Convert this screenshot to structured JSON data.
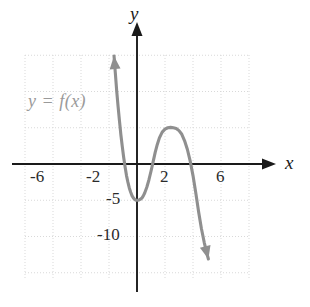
{
  "figure": {
    "background_color": "#ffffff",
    "curve_color": "#8f8f8f",
    "axis_color": "#1a1a1a",
    "grid_color": "#d9d9d9",
    "label_color": "#3a3a3a",
    "function_label_color": "#9a9a9a"
  },
  "labels": {
    "x_axis": "x",
    "y_axis": "y",
    "function": "y = f(x)"
  },
  "chart_data": {
    "type": "line",
    "title": "",
    "xlabel": "x",
    "ylabel": "y",
    "grid": true,
    "legend": "none",
    "annotations": [
      {
        "text": "y = f(x)",
        "x": -5.2,
        "y": 7.6
      }
    ],
    "xlim": [
      -8.2,
      8.2
    ],
    "ylim": [
      -13.5,
      15.5
    ],
    "xticks": [
      -6,
      -2,
      2,
      6
    ],
    "xtick_labels": [
      "-6",
      "-2",
      "2",
      "6"
    ],
    "yticks": [
      -5,
      -10
    ],
    "ytick_labels": [
      "-5",
      "-10"
    ],
    "x_gridlines": [
      -8,
      -6,
      -4,
      -2,
      2,
      4,
      6,
      8
    ],
    "y_gridlines": [
      15,
      10,
      5,
      -5,
      -10,
      -15
    ],
    "arrows": {
      "x_axis_end": "right",
      "y_axis_end": "up",
      "curve_start": "up-left",
      "curve_end": "down-right"
    },
    "series": [
      {
        "name": "f",
        "x": [
          -1.64,
          -1.55,
          -1.45,
          -1.35,
          -1.25,
          -1.15,
          -1.05,
          -0.95,
          -0.85,
          -0.75,
          -0.65,
          -0.55,
          -0.45,
          -0.35,
          -0.25,
          -0.15,
          -0.05,
          0.05,
          0.15,
          0.25,
          0.35,
          0.45,
          0.55,
          0.7,
          0.85,
          1.0,
          1.15,
          1.3,
          1.45,
          1.6,
          1.8,
          2.0,
          2.2,
          2.4,
          2.6,
          2.8,
          3.0,
          3.2,
          3.4,
          3.6,
          3.8,
          4.0,
          4.2,
          4.4,
          4.6,
          4.8,
          5.0,
          5.1
        ],
        "y": [
          14.9,
          12.6,
          10.1,
          7.9,
          5.9,
          4.0,
          2.4,
          0.9,
          -0.4,
          -1.6,
          -2.5,
          -3.3,
          -3.9,
          -4.4,
          -4.7,
          -4.9,
          -5.0,
          -5.0,
          -4.95,
          -4.85,
          -4.7,
          -4.4,
          -4.0,
          -3.2,
          -2.2,
          -1.0,
          0.3,
          1.6,
          2.7,
          3.6,
          4.4,
          4.8,
          5.0,
          5.05,
          5.0,
          4.9,
          4.6,
          4.1,
          3.2,
          2.0,
          0.4,
          -1.6,
          -4.0,
          -6.6,
          -8.9,
          -10.8,
          -12.4,
          -13.1
        ]
      }
    ],
    "features": {
      "local_minimum": {
        "x": 0.0,
        "y": -5.0
      },
      "local_maximum": {
        "x": 2.35,
        "y": 5.05
      },
      "x_intercepts": [
        -0.9,
        1.1,
        3.95
      ],
      "y_intercept": -5.0
    }
  }
}
